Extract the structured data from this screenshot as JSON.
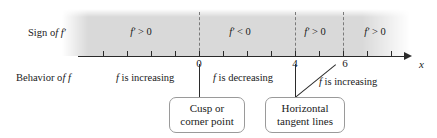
{
  "figure": {
    "row_labels": {
      "sign": "Sign of f′",
      "behavior": "Behavior of f"
    },
    "axis": {
      "variable_label": "x",
      "tick_values": [
        "0",
        "4",
        "6"
      ],
      "tick_count": 14
    },
    "sign_intervals": [
      {
        "label": "f′ > 0"
      },
      {
        "label": "f′ < 0"
      },
      {
        "label": "f′ > 0"
      },
      {
        "label": "f′ > 0"
      }
    ],
    "behavior_intervals": [
      {
        "label": "f is increasing"
      },
      {
        "label": "f is decreasing"
      },
      {
        "label": "f is increasing"
      }
    ],
    "callouts": [
      {
        "line1": "Cusp or",
        "line2": "corner point"
      },
      {
        "line1": "Horizontal",
        "line2": "tangent lines"
      }
    ],
    "colors": {
      "band": "#d9d9d9",
      "axis": "#2b2b2b",
      "dashed": "#7a7a7a",
      "callout_border": "#9a9a9a"
    }
  }
}
